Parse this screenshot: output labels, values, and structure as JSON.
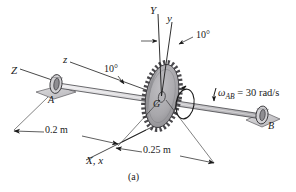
{
  "figure": {
    "caption": "(a)",
    "background_color": "#ffffff",
    "line_color": "#1a1a1a",
    "gear_fill": "#a9a8ac",
    "gear_fill_dark": "#8d8c90",
    "bracket_fill": "#c9c8cb",
    "shaft_fill": "#d8d7da"
  },
  "axes": [
    {
      "name": "Y-axis-fixed",
      "label": "Y",
      "label_x": 150,
      "label_y": 5
    },
    {
      "name": "y-axis-body",
      "label": "y",
      "label_x": 167,
      "label_y": 13
    },
    {
      "name": "Z-axis-fixed",
      "label": "Z",
      "label_x": 11,
      "label_y": 65
    },
    {
      "name": "z-axis-body",
      "label": "z",
      "label_x": 63,
      "label_y": 58
    },
    {
      "name": "X-x-axis",
      "label": "X, x",
      "label_x": 86,
      "label_y": 155
    }
  ],
  "angles": [
    {
      "name": "angle-y-tilt",
      "label": "10°",
      "label_x": 196,
      "label_y": 30
    },
    {
      "name": "angle-z-tilt",
      "label": "10°",
      "label_x": 104,
      "label_y": 66
    }
  ],
  "bearings": [
    {
      "name": "bearing-A",
      "label": "A",
      "label_x": 48,
      "label_y": 95
    },
    {
      "name": "bearing-B",
      "label": "B",
      "label_x": 268,
      "label_y": 121
    }
  ],
  "center_of_mass": {
    "label": "G",
    "label_x": 153,
    "label_y": 99
  },
  "angular_velocity": {
    "symbol": "ω",
    "subscript": "AB",
    "equals": " = 30 rad/s",
    "value": 30,
    "units": "rad/s",
    "label_x": 218,
    "label_y": 90
  },
  "dimensions": [
    {
      "name": "dimension-0.2m",
      "label": "0.2 m",
      "value": 0.2,
      "units": "m",
      "label_x": 45,
      "label_y": 129
    },
    {
      "name": "dimension-0.25m",
      "label": "0.25 m",
      "value": 0.25,
      "units": "m",
      "label_x": 143,
      "label_y": 148
    }
  ]
}
